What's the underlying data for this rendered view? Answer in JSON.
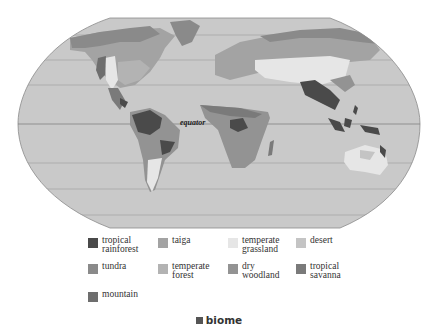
{
  "map": {
    "projection": "robinson",
    "equator_label": "equator",
    "ocean_color": "#c9c9c9",
    "outline_color": "#8a8a8a",
    "gridline_color": "#9a9a9a"
  },
  "legend": {
    "items": [
      {
        "key": "tropical-rainforest",
        "label": "tropical\nrainforest",
        "color": "#4a4a4a"
      },
      {
        "key": "taiga",
        "label": "taiga",
        "color": "#a3a3a3"
      },
      {
        "key": "temperate-grassland",
        "label": "temperate\ngrassland",
        "color": "#e6e6e6"
      },
      {
        "key": "desert",
        "label": "desert",
        "color": "#c4c4c4"
      },
      {
        "key": "tundra",
        "label": "tundra",
        "color": "#8a8a8a"
      },
      {
        "key": "temperate-forest",
        "label": "temperate\nforest",
        "color": "#b3b3b3"
      },
      {
        "key": "dry-woodland",
        "label": "dry\nwoodland",
        "color": "#939393"
      },
      {
        "key": "tropical-savanna",
        "label": "tropical\nsavanna",
        "color": "#7a7a7a"
      },
      {
        "key": "mountain",
        "label": "mountain",
        "color": "#6e6e6e"
      }
    ]
  },
  "caption": {
    "label": "biome"
  }
}
